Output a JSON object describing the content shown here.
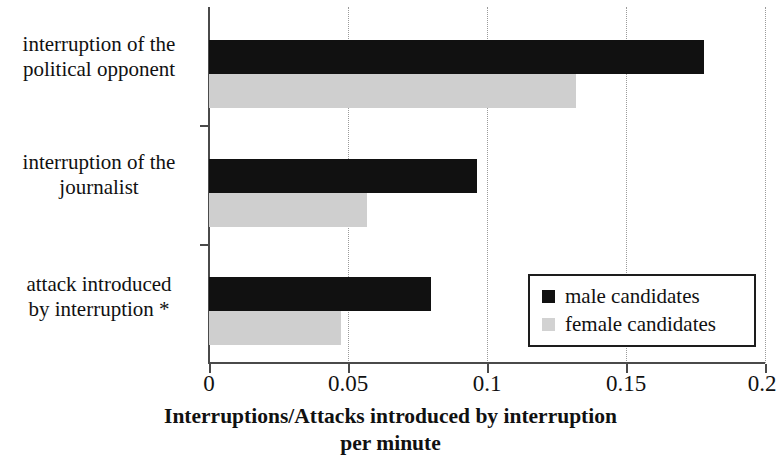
{
  "chart_data": {
    "type": "bar",
    "orientation": "horizontal",
    "title": "",
    "xlabel": "Interruptions/Attacks introduced by interruption per minute",
    "xlabel_line1": "Interruptions/Attacks introduced by interruption",
    "xlabel_line2": "per minute",
    "ylabel": "",
    "categories": [
      "interruption of the political opponent",
      "interruption of the journalist",
      "attack introduced by interruption *"
    ],
    "category_lines": [
      [
        "interruption of the",
        "political opponent"
      ],
      [
        "interruption of the",
        "journalist"
      ],
      [
        "attack introduced",
        "by interruption *"
      ]
    ],
    "series": [
      {
        "name": "male candidates",
        "color": "#111111",
        "values": [
          0.178,
          0.0965,
          0.0798
        ]
      },
      {
        "name": "female candidates",
        "color": "#cfcfcf",
        "values": [
          0.132,
          0.0568,
          0.0475
        ]
      }
    ],
    "xlim": [
      0,
      0.2
    ],
    "xticks": [
      0,
      0.05,
      0.1,
      0.15,
      0.2
    ],
    "xtick_labels": [
      "0",
      "0.05",
      "0.1",
      "0.15",
      "0.2"
    ],
    "grid": "vertical-dotted",
    "legend_position": "bottom-right",
    "legend_entries": [
      "male candidates",
      "female candidates"
    ],
    "footnote_marker": "*"
  },
  "legend": {
    "entries": [
      {
        "label": "male candidates",
        "swatch": "male"
      },
      {
        "label": "female candidates",
        "swatch": "female"
      }
    ]
  },
  "axis": {
    "tick_labels": [
      "0",
      "0.05",
      "0.1",
      "0.15",
      "0.2"
    ],
    "title_line1": "Interruptions/Attacks introduced by interruption",
    "title_line2": "per minute"
  },
  "categories": [
    {
      "line1": "interruption of the",
      "line2": "political opponent"
    },
    {
      "line1": "interruption of the",
      "line2": "journalist"
    },
    {
      "line1": "attack introduced",
      "line2": "by interruption *"
    }
  ]
}
